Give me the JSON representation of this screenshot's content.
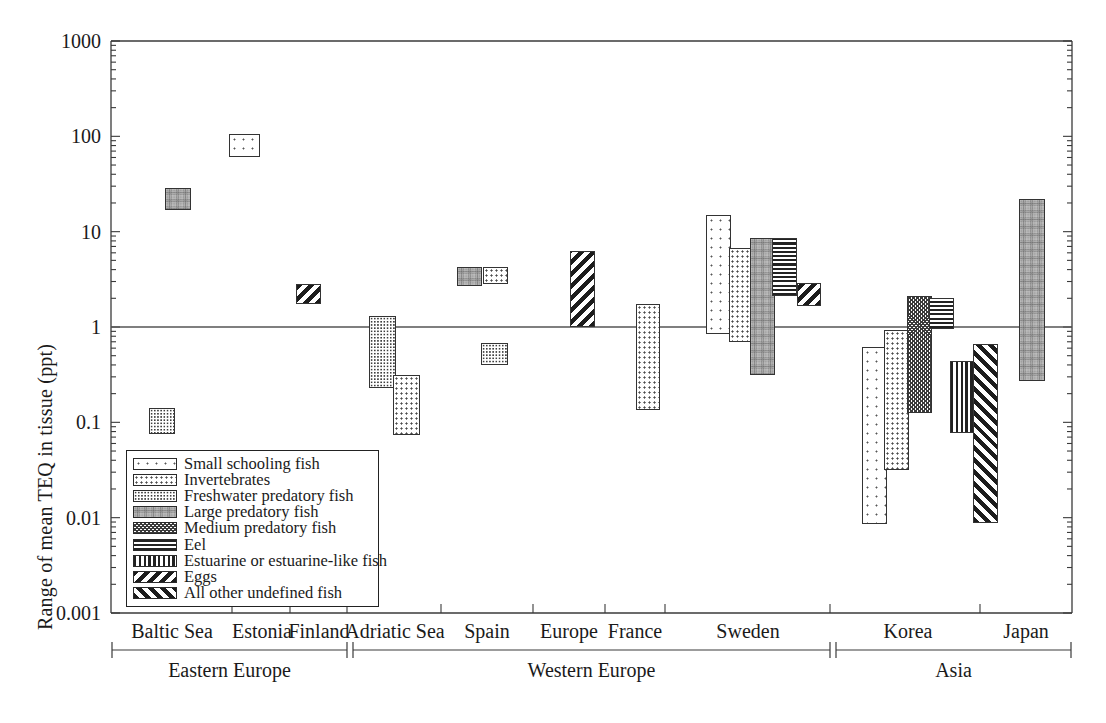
{
  "axes": {
    "ylabel": "Range of mean TEQ in tissue (ppt)",
    "ytick_labels": [
      "1000",
      "100",
      "10",
      "1",
      "0.1",
      "0.01",
      "0.001"
    ],
    "ytick_values": [
      1000,
      100,
      10,
      1,
      0.1,
      0.01,
      0.001
    ],
    "ylim": [
      0.001,
      1000
    ],
    "yscale": "log",
    "reference_line": 1
  },
  "legend": {
    "items": [
      {
        "label": "Small schooling fish",
        "pattern": "sparse-dots"
      },
      {
        "label": "Invertebrates",
        "pattern": "dots"
      },
      {
        "label": "Freshwater predatory fish",
        "pattern": "dense-dots"
      },
      {
        "label": "Large predatory fish",
        "pattern": "stipple"
      },
      {
        "label": "Medium predatory fish",
        "pattern": "check"
      },
      {
        "label": "Eel",
        "pattern": "hlines"
      },
      {
        "label": "Estuarine or estuarine-like fish",
        "pattern": "vlines"
      },
      {
        "label": "Eggs",
        "pattern": "bslash"
      },
      {
        "label": "All other undefined fish",
        "pattern": "fslash"
      }
    ]
  },
  "regions": [
    {
      "label": "Baltic Sea",
      "group": "Eastern Europe"
    },
    {
      "label": "Estonia",
      "group": "Eastern Europe"
    },
    {
      "label": "Finland",
      "group": "Eastern Europe"
    },
    {
      "label": "Adriatic Sea",
      "group": "Western Europe"
    },
    {
      "label": "Spain",
      "group": "Western Europe"
    },
    {
      "label": "Europe",
      "group": "Western Europe"
    },
    {
      "label": "France",
      "group": "Western Europe"
    },
    {
      "label": "Sweden",
      "group": "Western Europe"
    },
    {
      "label": "Korea",
      "group": "Asia"
    },
    {
      "label": "Japan",
      "group": "Asia"
    }
  ],
  "groups": [
    {
      "label": "Eastern Europe",
      "x0": 112,
      "x1": 347
    },
    {
      "label": "Western Europe",
      "x0": 353,
      "x1": 830
    },
    {
      "label": "Asia",
      "x0": 836,
      "x1": 1071
    }
  ],
  "chart_data": {
    "type": "bar",
    "title": "",
    "xlabel": "",
    "ylabel": "Range of mean TEQ in tissue (ppt)",
    "yscale": "log",
    "ylim": [
      0.001,
      1000
    ],
    "ytick_labels": [
      "1000",
      "100",
      "10",
      "1",
      "0.1",
      "0.01",
      "0.001"
    ],
    "grid": false,
    "legend_position": "lower-left-inside",
    "reference_line_y": 1,
    "note": "Each bar is a floating range (low to high) of mean TEQ; fill pattern encodes fish category.",
    "bars": [
      {
        "region": "Baltic Sea",
        "category": "Small schooling fish",
        "pattern": "dense-dots",
        "low": 0.075,
        "high": 0.14,
        "x": 149,
        "w": 26
      },
      {
        "region": "Baltic Sea",
        "category": "Large predatory fish",
        "pattern": "stipple",
        "low": 17.0,
        "high": 29.0,
        "x": 165,
        "w": 26
      },
      {
        "region": "Estonia",
        "category": "Small schooling fish",
        "pattern": "sparse-dots",
        "low": 60.0,
        "high": 105.0,
        "x": 229,
        "w": 31
      },
      {
        "region": "Finland",
        "category": "Eggs",
        "pattern": "bslash",
        "low": 1.75,
        "high": 2.8,
        "x": 296,
        "w": 25
      },
      {
        "region": "Adriatic Sea",
        "category": "Small schooling fish",
        "pattern": "dense-dots",
        "low": 0.23,
        "high": 1.3,
        "x": 369,
        "w": 27
      },
      {
        "region": "Adriatic Sea",
        "category": "Invertebrates",
        "pattern": "dots",
        "low": 0.073,
        "high": 0.31,
        "x": 393,
        "w": 27
      },
      {
        "region": "Spain",
        "category": "Small schooling fish",
        "pattern": "dense-dots",
        "low": 0.4,
        "high": 0.68,
        "x": 481,
        "w": 27
      },
      {
        "region": "Spain",
        "category": "Large predatory fish",
        "pattern": "stipple",
        "low": 2.7,
        "high": 4.3,
        "x": 457,
        "w": 25
      },
      {
        "region": "Spain",
        "category": "Invertebrates",
        "pattern": "dots",
        "low": 2.8,
        "high": 4.3,
        "x": 483,
        "w": 25
      },
      {
        "region": "Europe",
        "category": "Eggs",
        "pattern": "bslash",
        "low": 1.0,
        "high": 6.3,
        "x": 570,
        "w": 25
      },
      {
        "region": "France",
        "category": "Invertebrates",
        "pattern": "dots",
        "low": 0.135,
        "high": 1.75,
        "x": 636,
        "w": 24
      },
      {
        "region": "Sweden",
        "category": "Small schooling fish",
        "pattern": "sparse-dots",
        "low": 0.85,
        "high": 15.0,
        "x": 706,
        "w": 25
      },
      {
        "region": "Sweden",
        "category": "Invertebrates",
        "pattern": "dots",
        "low": 0.7,
        "high": 6.7,
        "x": 729,
        "w": 24
      },
      {
        "region": "Sweden",
        "category": "Large predatory fish",
        "pattern": "stipple",
        "low": 0.31,
        "high": 8.6,
        "x": 750,
        "w": 25
      },
      {
        "region": "Sweden",
        "category": "Eel",
        "pattern": "hlines",
        "low": 2.1,
        "high": 8.6,
        "x": 772,
        "w": 25
      },
      {
        "region": "Sweden",
        "category": "Eggs",
        "pattern": "bslash",
        "low": 1.65,
        "high": 2.9,
        "x": 797,
        "w": 24
      },
      {
        "region": "Korea",
        "category": "Small schooling fish",
        "pattern": "sparse-dots",
        "low": 0.0086,
        "high": 0.62,
        "x": 862,
        "w": 25
      },
      {
        "region": "Korea",
        "category": "Invertebrates",
        "pattern": "dots",
        "low": 0.032,
        "high": 0.93,
        "x": 884,
        "w": 25
      },
      {
        "region": "Korea",
        "category": "Medium predatory fish",
        "pattern": "check",
        "low": 0.125,
        "high": 2.1,
        "x": 907,
        "w": 25
      },
      {
        "region": "Korea",
        "category": "Eel",
        "pattern": "hlines",
        "low": 0.95,
        "high": 2.0,
        "x": 929,
        "w": 25
      },
      {
        "region": "Korea",
        "category": "Estuarine or estuarine-like fish",
        "pattern": "vlines",
        "low": 0.077,
        "high": 0.44,
        "x": 950,
        "w": 24
      },
      {
        "region": "Korea",
        "category": "All other undefined fish",
        "pattern": "fslash",
        "low": 0.0087,
        "high": 0.66,
        "x": 973,
        "w": 25
      },
      {
        "region": "Japan",
        "category": "Large predatory fish",
        "pattern": "stipple",
        "low": 0.27,
        "high": 22.0,
        "x": 1019,
        "w": 26
      }
    ]
  }
}
